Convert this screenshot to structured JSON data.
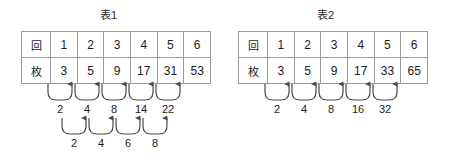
{
  "figures": [
    {
      "title": "表1",
      "table": {
        "row_labels": [
          "回",
          "枚"
        ],
        "header": [
          "1",
          "2",
          "3",
          "4",
          "5",
          "6"
        ],
        "values": [
          "3",
          "5",
          "9",
          "17",
          "31",
          "53"
        ]
      },
      "first_differences": [
        "2",
        "4",
        "8",
        "14",
        "22"
      ],
      "second_differences": [
        "2",
        "4",
        "6",
        "8"
      ]
    },
    {
      "title": "表2",
      "table": {
        "row_labels": [
          "回",
          "枚"
        ],
        "header": [
          "1",
          "2",
          "3",
          "4",
          "5",
          "6"
        ],
        "values": [
          "3",
          "5",
          "9",
          "17",
          "33",
          "65"
        ]
      },
      "first_differences": [
        "2",
        "4",
        "8",
        "16",
        "32"
      ],
      "second_differences": []
    }
  ],
  "colors": {
    "background": "#ffffff",
    "table_border": "#9a9a9a",
    "text": "#1c1c1c",
    "arrow": "#4a4a4a"
  }
}
